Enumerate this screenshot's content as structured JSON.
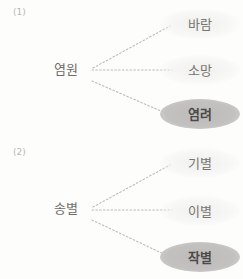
{
  "diagram": {
    "title": "",
    "background_color": "#fdfdfc",
    "highlight_color": "#bdbcba",
    "text_color": "#6e6c6a",
    "connector_color": "#bcbcba",
    "groups": [
      {
        "index_label": "(1)",
        "center": "염원",
        "targets": [
          {
            "label": "바람",
            "highlighted": false
          },
          {
            "label": "소망",
            "highlighted": false
          },
          {
            "label": "염려",
            "highlighted": true
          }
        ]
      },
      {
        "index_label": "(2)",
        "center": "송별",
        "targets": [
          {
            "label": "기별",
            "highlighted": false
          },
          {
            "label": "이별",
            "highlighted": false
          },
          {
            "label": "작별",
            "highlighted": true
          }
        ]
      }
    ]
  }
}
